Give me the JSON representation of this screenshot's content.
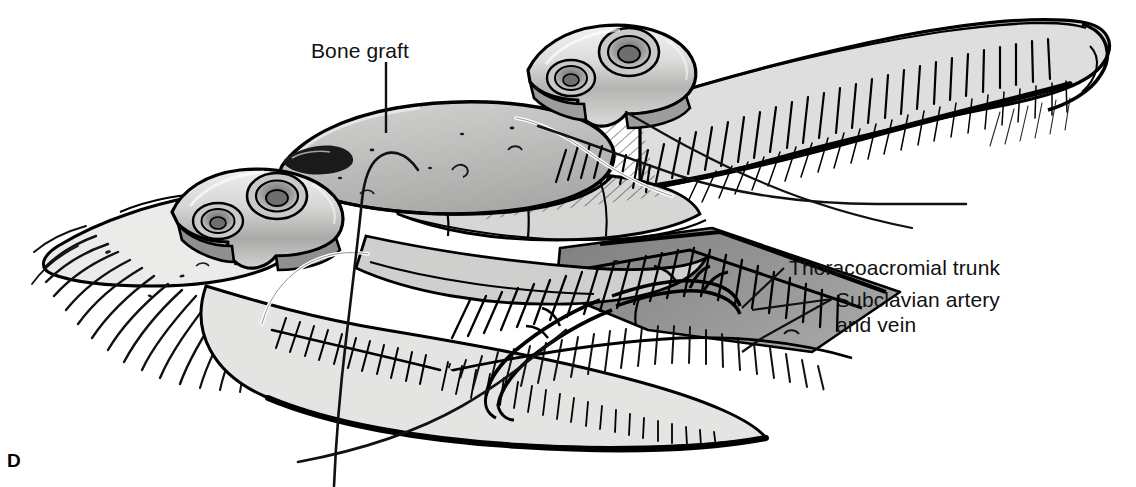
{
  "figure": {
    "panel_letter": "D",
    "background_color": "#ffffff",
    "ink_color": "#000000"
  },
  "labels": {
    "bone_graft": "Bone graft",
    "thoracoacromial": "Thoracoacromial trunk",
    "subclavian_line1": "Subclavian artery",
    "subclavian_line2": "and vein"
  },
  "palette": {
    "outline": "#000000",
    "bone_light": "#d8d8d6",
    "bone_mid": "#c3c3c1",
    "graft_fill": "#b9b9b7",
    "metal_light": "#e6e6e4",
    "metal_mid": "#bdbdbb",
    "metal_dark": "#8f8f8d",
    "shadow_band": "#8a8a8a",
    "muscle_fill": "#cfcfcd",
    "tissue_pale": "#e9e9e7",
    "suture_white": "#ffffff"
  },
  "hardware": {
    "plate_count": 2,
    "screw_holes_per_plate": 2,
    "left_plate_screw_holes": 2,
    "right_plate_screw_holes": 2
  },
  "leaders": {
    "bone_graft_leader": "vertical line from label down to graft surface",
    "thoracoacromial_leader": "diagonal line from label left-down to vessel",
    "subclavian_leader": "forked diagonal lines from label to artery and vein"
  }
}
